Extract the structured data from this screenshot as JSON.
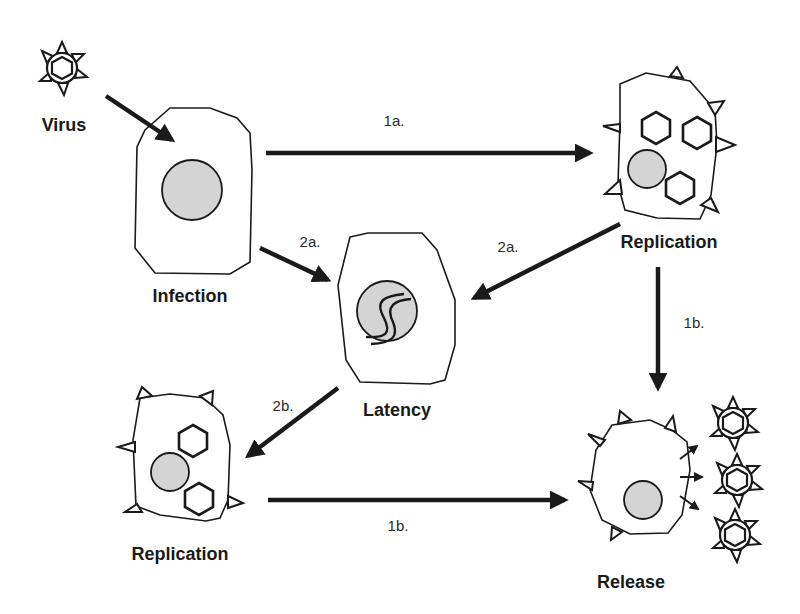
{
  "colors": {
    "stroke": "#1a1a1a",
    "nucleus_fill": "#d4d4d4",
    "background": "#ffffff"
  },
  "nodes": {
    "virus": {
      "label": "Virus"
    },
    "infection": {
      "label": "Infection"
    },
    "replication_top": {
      "label": "Replication"
    },
    "latency": {
      "label": "Latency"
    },
    "replication_bottom": {
      "label": "Replication"
    },
    "release": {
      "label": "Release"
    }
  },
  "edges": [
    {
      "from": "virus",
      "to": "infection",
      "label": ""
    },
    {
      "from": "infection",
      "to": "replication_top",
      "label": "1a."
    },
    {
      "from": "infection",
      "to": "latency",
      "label": "2a."
    },
    {
      "from": "replication_top",
      "to": "latency",
      "label": "2a."
    },
    {
      "from": "replication_top",
      "to": "release",
      "label": "1b."
    },
    {
      "from": "latency",
      "to": "replication_bottom",
      "label": "2b."
    },
    {
      "from": "replication_bottom",
      "to": "release",
      "label": "1b."
    }
  ]
}
